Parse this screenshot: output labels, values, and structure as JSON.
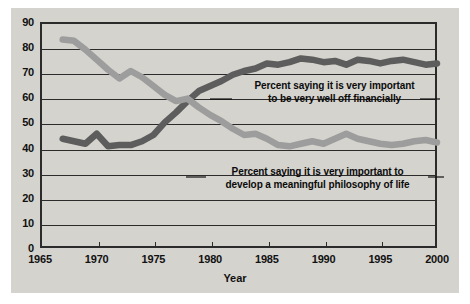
{
  "chart_data": {
    "type": "line",
    "title": "",
    "xlabel": "Year",
    "ylabel": "",
    "xlim": [
      1965,
      2000
    ],
    "ylim": [
      0,
      90
    ],
    "ytick_labels": [
      "90",
      "80",
      "70",
      "60",
      "50",
      "40",
      "30",
      "20",
      "10",
      "0"
    ],
    "yticks": [
      90,
      80,
      70,
      60,
      50,
      40,
      30,
      20,
      10,
      0
    ],
    "xtick_labels": [
      "1965",
      "1970",
      "1975",
      "1980",
      "1985",
      "1990",
      "1995",
      "2000"
    ],
    "xticks": [
      1965,
      1970,
      1975,
      1980,
      1985,
      1990,
      1995,
      2000
    ],
    "grid": "horizontal",
    "legend": "annotations-inline",
    "series": [
      {
        "name": "Percent saying it is very important to be very well off financially",
        "color": "#5d5d5d",
        "x": [
          1967,
          1968,
          1969,
          1970,
          1971,
          1972,
          1973,
          1974,
          1975,
          1976,
          1977,
          1978,
          1979,
          1980,
          1981,
          1982,
          1983,
          1984,
          1985,
          1986,
          1987,
          1988,
          1989,
          1990,
          1991,
          1992,
          1993,
          1994,
          1995,
          1996,
          1997,
          1998,
          1999,
          2000
        ],
        "y": [
          43.5,
          42.5,
          41.5,
          45.5,
          40.5,
          41.0,
          41.0,
          42.5,
          45.0,
          50.0,
          54.0,
          58.5,
          62.5,
          64.5,
          66.5,
          69.0,
          70.5,
          71.5,
          73.5,
          73.0,
          74.0,
          75.5,
          75.0,
          74.0,
          74.5,
          73.0,
          75.0,
          74.5,
          73.5,
          74.5,
          75.0,
          74.0,
          73.0,
          73.5
        ]
      },
      {
        "name": "Percent saying it is very important to develop a meaningful philosophy of life",
        "color": "#9d9d9d",
        "x": [
          1967,
          1968,
          1969,
          1970,
          1971,
          1972,
          1973,
          1974,
          1975,
          1976,
          1977,
          1978,
          1979,
          1980,
          1981,
          1982,
          1983,
          1984,
          1985,
          1986,
          1987,
          1988,
          1989,
          1990,
          1991,
          1992,
          1993,
          1994,
          1995,
          1996,
          1997,
          1998,
          1999,
          2000
        ],
        "y": [
          83.0,
          82.5,
          79.0,
          75.0,
          71.0,
          67.5,
          70.5,
          68.0,
          64.5,
          61.0,
          58.5,
          59.5,
          56.0,
          53.0,
          50.5,
          47.5,
          45.0,
          45.5,
          43.5,
          41.0,
          40.5,
          41.5,
          42.5,
          41.5,
          43.5,
          45.5,
          43.5,
          42.5,
          41.5,
          41.0,
          41.5,
          42.5,
          43.0,
          42.0
        ]
      }
    ],
    "annotations": [
      {
        "id": "financially-label",
        "line1": "Percent saying it is very important",
        "line2": "to be very well off financially"
      },
      {
        "id": "philosophy-label",
        "line1": "Percent saying it is very important to",
        "line2": "develop a meaningful philosophy of life"
      }
    ],
    "colors": {
      "background": "#d5d3ce",
      "page": "#ffffff",
      "axis": "#2b2b2b",
      "financially_line": "#5d5d5d",
      "philosophy_line": "#9d9d9d"
    }
  }
}
